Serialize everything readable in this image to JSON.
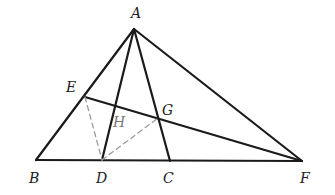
{
  "figure": {
    "type": "geometry",
    "points": {
      "A": {
        "label": "A",
        "x": 134,
        "y": 29,
        "lx": 131,
        "ly": 18
      },
      "B": {
        "label": "B",
        "x": 36,
        "y": 160,
        "lx": 29,
        "ly": 183
      },
      "D": {
        "label": "D",
        "x": 102,
        "y": 160,
        "lx": 96,
        "ly": 183
      },
      "C": {
        "label": "C",
        "x": 170,
        "y": 161,
        "lx": 163,
        "ly": 183
      },
      "F": {
        "label": "F",
        "x": 302,
        "y": 161,
        "lx": 300,
        "ly": 183
      },
      "E": {
        "label": "E",
        "x": 85,
        "y": 97,
        "lx": 66,
        "ly": 92
      },
      "H": {
        "label": "H",
        "x": 115,
        "y": 107,
        "lx": 113,
        "ly": 127
      },
      "G": {
        "label": "G",
        "x": 158,
        "y": 118,
        "lx": 162,
        "ly": 115
      }
    },
    "solid_segments": [
      [
        "A",
        "B"
      ],
      [
        "A",
        "F"
      ],
      [
        "B",
        "F"
      ],
      [
        "A",
        "D"
      ],
      [
        "A",
        "C"
      ],
      [
        "E",
        "F"
      ]
    ],
    "dashed_segments": [
      [
        "E",
        "D"
      ],
      [
        "D",
        "G"
      ]
    ],
    "colors": {
      "solid": "#1a1a1a",
      "dashed": "#9a9a9a"
    }
  }
}
